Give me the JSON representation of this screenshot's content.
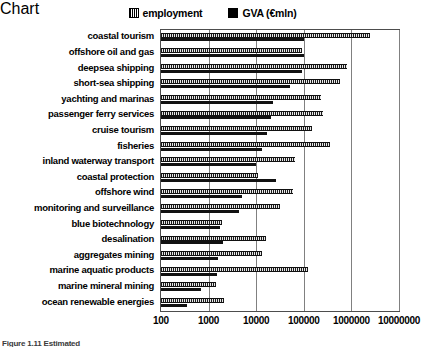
{
  "legend": {
    "entries": [
      {
        "label": "employment",
        "icon": "hatched-square-icon",
        "color": "#1a1a1a"
      },
      {
        "label": "GVA (€mln)",
        "icon": "filled-square-icon",
        "color": "#111111"
      }
    ]
  },
  "axis": {
    "x_tick_labels": [
      "100",
      "1000",
      "10000",
      "100000",
      "1000000",
      "10000000"
    ]
  },
  "caption": {
    "text": "Figure 1.11  Estimated"
  },
  "chart_data": {
    "type": "bar",
    "orientation": "horizontal",
    "title": "",
    "xlabel": "",
    "ylabel": "",
    "xscale": "log",
    "xlim": [
      100,
      10000000
    ],
    "xticks": [
      100,
      1000,
      10000,
      100000,
      1000000,
      10000000
    ],
    "xticklabels": [
      "100",
      "1000",
      "10000",
      "100000",
      "1000000",
      "10000000"
    ],
    "grid": true,
    "legend_position": "top-center",
    "categories": [
      "coastal tourism",
      "offshore oil and gas",
      "deepsea shipping",
      "short-sea shipping",
      "yachting and marinas",
      "passenger ferry services",
      "cruise tourism",
      "fisheries",
      "inland waterway transport",
      "coastal protection",
      "offshore wind",
      "monitoring and surveillance",
      "blue biotechnology",
      "desalination",
      "aggregates mining",
      "marine aquatic products",
      "marine mineral mining",
      "ocean renewable energies"
    ],
    "series": [
      {
        "name": "employment",
        "values": [
          2500000,
          90000,
          800000,
          580000,
          230000,
          250000,
          150000,
          350000,
          65000,
          11000,
          58000,
          32000,
          1900,
          16000,
          13000,
          120000,
          1400,
          2100
        ]
      },
      {
        "name": "GVA (€mln)",
        "values": [
          100000,
          100000,
          90000,
          52000,
          23000,
          20000,
          17000,
          13000,
          10000,
          26000,
          5000,
          4300,
          1700,
          2000,
          1600,
          1500,
          680,
          350
        ]
      }
    ]
  }
}
